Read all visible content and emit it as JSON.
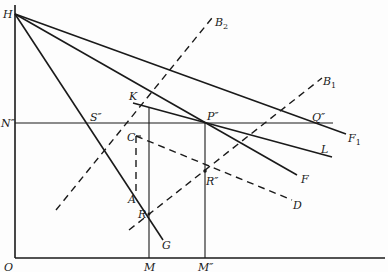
{
  "figure": {
    "type": "geometric-economics-diagram",
    "axes": {
      "origin_label": "O",
      "vertical_axis_top_label": "H",
      "horizontal_ticks": [
        "M",
        "M″"
      ],
      "vertical_ticks": [
        "N″"
      ]
    },
    "labels": {
      "H": "H",
      "O": "O",
      "N2": "N″",
      "S2": "S″",
      "K": "K",
      "P2": "P″",
      "Q2": "Q″",
      "C": "C",
      "A": "A",
      "R": "R",
      "R2": "R″",
      "G": "G",
      "F": "F",
      "F1": "F",
      "F1_sub": "1",
      "L": "L",
      "D": "D",
      "B1": "B",
      "B1_sub": "1",
      "B2": "B",
      "B2_sub": "2",
      "M": "M",
      "M2": "M″"
    },
    "lines": [
      {
        "name": "HF1",
        "style": "solid",
        "from": "H",
        "to": "F1"
      },
      {
        "name": "HKF",
        "style": "solid",
        "from": "H",
        "to": "F",
        "through": [
          "K",
          "R″"
        ]
      },
      {
        "name": "HARG",
        "style": "solid",
        "from": "H",
        "to": "G",
        "through": [
          "A",
          "R"
        ]
      },
      {
        "name": "KL",
        "style": "solid",
        "from": "K",
        "to": "L",
        "through": [
          "P″"
        ]
      },
      {
        "name": "N2Q2",
        "style": "solid-thin",
        "from": "N″",
        "to": "Q″",
        "through": [
          "S″",
          "P″"
        ]
      },
      {
        "name": "KM",
        "style": "solid-thin",
        "from": "K",
        "to": "M"
      },
      {
        "name": "P2M2",
        "style": "solid-thin",
        "from": "P″",
        "to": "M″"
      },
      {
        "name": "B2",
        "style": "dashed",
        "through": [
          "S″",
          "K"
        ]
      },
      {
        "name": "B1",
        "style": "dashed",
        "through": [
          "R",
          "R″",
          "Q″"
        ]
      },
      {
        "name": "CA",
        "style": "dashed",
        "from": "C",
        "to": "A"
      },
      {
        "name": "CD",
        "style": "dashed",
        "from": "C",
        "to": "D",
        "through": [
          "R″"
        ]
      }
    ]
  }
}
